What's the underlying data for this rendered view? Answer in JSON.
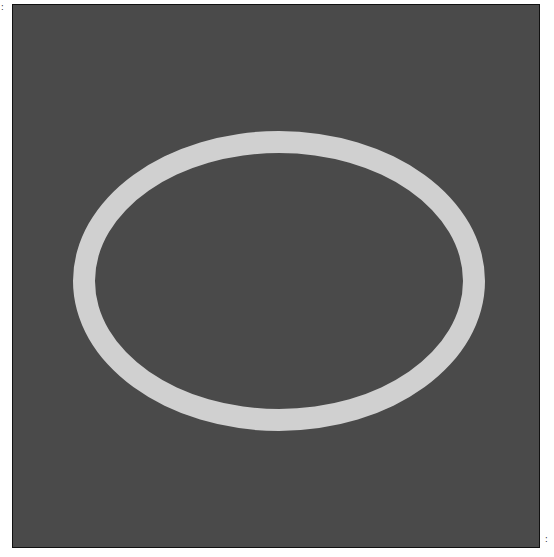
{
  "image": {
    "background_color": "#4a4a4a",
    "ring_color": "#d0d0d0",
    "shape": "ellipse-ring"
  },
  "marks": {
    "top_left": ":",
    "bottom_right": ":"
  }
}
